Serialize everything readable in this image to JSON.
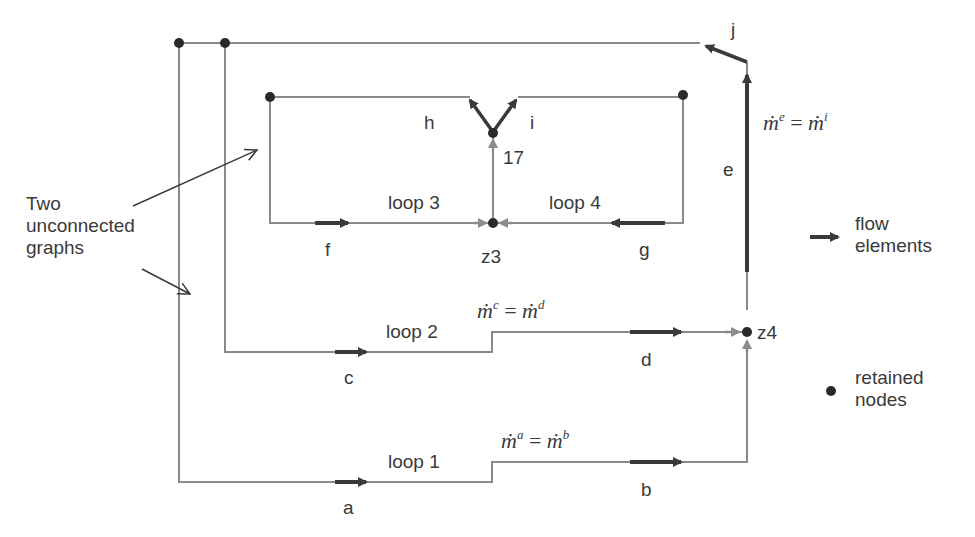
{
  "diagram": {
    "annotation": {
      "line1": "Two",
      "line2": "unconnected",
      "line3": "graphs"
    },
    "loops": {
      "loop1": "loop 1",
      "loop2": "loop 2",
      "loop3": "loop 3",
      "loop4": "loop 4"
    },
    "elements": {
      "a": "a",
      "b": "b",
      "c": "c",
      "d": "d",
      "e": "e",
      "f": "f",
      "g": "g",
      "h": "h",
      "i": "i",
      "j": "j"
    },
    "nodes": {
      "z3": "z3",
      "z4": "z4",
      "n17": "17"
    },
    "equations": {
      "ab": {
        "lhs_base": "ṁ",
        "lhs_sup": "a",
        "eq": " = ",
        "rhs_base": "ṁ",
        "rhs_sup": "b"
      },
      "cd": {
        "lhs_base": "ṁ",
        "lhs_sup": "c",
        "eq": " = ",
        "rhs_base": "ṁ",
        "rhs_sup": "d"
      },
      "ei": {
        "lhs_base": "ṁ",
        "lhs_sup": "e",
        "eq": " = ",
        "rhs_base": "ṁ",
        "rhs_sup": "i"
      }
    },
    "legend": {
      "flow_line1": "flow",
      "flow_line2": "elements",
      "nodes_line1": "retained",
      "nodes_line2": "nodes"
    },
    "colors": {
      "line": "#8a8a8a",
      "arrow_dark": "#3a3a3a",
      "arrow_light": "#8c8c8c",
      "node": "#2a2a2a"
    }
  }
}
